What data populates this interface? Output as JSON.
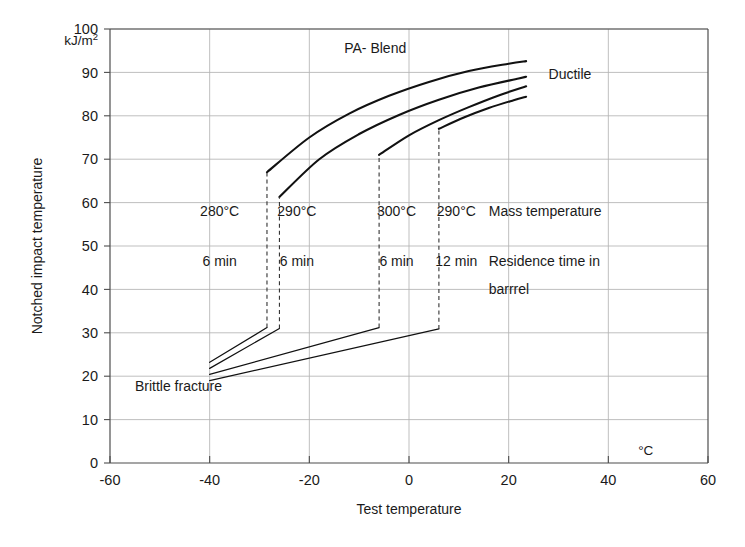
{
  "chart_data": {
    "type": "line",
    "title": "PA- Blend",
    "xlabel": "Test temperature",
    "ylabel": "Notched impact temperature",
    "x_unit": "°C",
    "y_unit": "kJ/m",
    "y_unit_sup": "2",
    "xlim": [
      -60,
      60
    ],
    "ylim": [
      0,
      100
    ],
    "xticks": [
      -60,
      -40,
      -20,
      0,
      20,
      40,
      60
    ],
    "xticklabels": [
      "-60",
      "-40",
      "-20",
      "0",
      "20",
      "40",
      "60"
    ],
    "yticks": [
      0,
      10,
      20,
      30,
      40,
      50,
      60,
      70,
      80,
      90,
      100
    ],
    "yticklabels": [
      "0",
      "10",
      "20",
      "30",
      "40",
      "50",
      "60",
      "70",
      "80",
      "90",
      "100"
    ],
    "grid": true,
    "legend": "none",
    "annotations": [
      {
        "name": "title-annotation",
        "text": "PA- Blend",
        "x": -13,
        "y": 94.5
      },
      {
        "name": "ductile-annotation",
        "text": "Ductile",
        "x": 28,
        "y": 88.5
      },
      {
        "name": "brittle-annotation",
        "text": "Brittle fracture",
        "x": -55,
        "y": 16.5
      },
      {
        "name": "mass-temperature-annotation",
        "text": "Mass temperature",
        "x": 16,
        "y": 57
      },
      {
        "name": "residence-time-annotation-line1",
        "text": "Residence time in",
        "x": 16,
        "y": 45.5
      },
      {
        "name": "residence-time-annotation-line2",
        "text": "barrrel",
        "x": 16,
        "y": 39
      }
    ],
    "condition_labels": [
      {
        "mass_temperature": "280°C",
        "residence_time": "6 min",
        "x": -38
      },
      {
        "mass_temperature": "290°C",
        "residence_time": "6 min",
        "x": -22.5
      },
      {
        "mass_temperature": "300°C",
        "residence_time": "6 min",
        "x": -2.5
      },
      {
        "mass_temperature": "290°C",
        "residence_time": "12 min",
        "x": 9.5
      }
    ],
    "condition_row_labels": {
      "mass_temperature_row_y": 57,
      "residence_time_row_y": 45.5
    },
    "series": [
      {
        "name": "280C-6min",
        "brittle_branch": [
          [
            -40,
            23.2
          ],
          [
            -28.5,
            31.2
          ]
        ],
        "transition_x": -28.5,
        "transition_from": 31.2,
        "transition_to": 67.0,
        "ductile_branch": [
          [
            -28.5,
            67.0
          ],
          [
            -20,
            75.0
          ],
          [
            -12,
            80.5
          ],
          [
            -4,
            84.6
          ],
          [
            4,
            87.8
          ],
          [
            12,
            90.3
          ],
          [
            20,
            92.0
          ],
          [
            23.5,
            92.6
          ]
        ]
      },
      {
        "name": "290C-6min",
        "brittle_branch": [
          [
            -40,
            21.8
          ],
          [
            -26.0,
            31.0
          ]
        ],
        "transition_x": -26.0,
        "transition_from": 31.0,
        "transition_to": 61.3,
        "ductile_branch": [
          [
            -26.0,
            61.3
          ],
          [
            -18,
            70.0
          ],
          [
            -10,
            75.8
          ],
          [
            -2,
            80.2
          ],
          [
            6,
            83.7
          ],
          [
            14,
            86.5
          ],
          [
            22,
            88.6
          ],
          [
            23.5,
            89.0
          ]
        ]
      },
      {
        "name": "300C-6min",
        "brittle_branch": [
          [
            -40,
            20.4
          ],
          [
            -6.0,
            31.2
          ]
        ],
        "transition_x": -6.0,
        "transition_from": 31.2,
        "transition_to": 71.0,
        "ductile_branch": [
          [
            -6.0,
            71.0
          ],
          [
            0,
            75.5
          ],
          [
            6,
            79.0
          ],
          [
            12,
            82.0
          ],
          [
            18,
            84.7
          ],
          [
            23.5,
            86.8
          ]
        ]
      },
      {
        "name": "290C-12min",
        "brittle_branch": [
          [
            -40,
            19.0
          ],
          [
            6.0,
            30.9
          ]
        ],
        "transition_x": 6.0,
        "transition_from": 30.9,
        "transition_to": 77.0,
        "ductile_branch": [
          [
            6.0,
            77.0
          ],
          [
            11,
            79.6
          ],
          [
            16,
            81.8
          ],
          [
            21,
            83.6
          ],
          [
            23.5,
            84.4
          ]
        ]
      }
    ]
  },
  "colors": {
    "curve": "#111111",
    "grid": "#b3b3b3",
    "axis": "#4d4d4d",
    "text": "#1a1a1a",
    "background": "#ffffff"
  }
}
